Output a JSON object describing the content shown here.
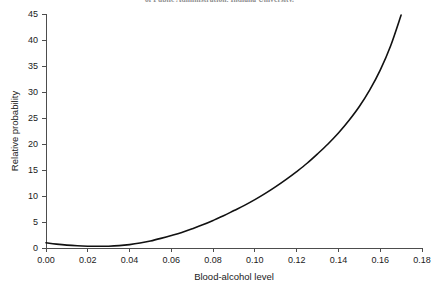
{
  "caption": {
    "cropped_top_line": "of Public Administration, Indiana University."
  },
  "chart_data": {
    "type": "line",
    "title": "",
    "xlabel": "Blood-alcohol level",
    "ylabel": "Relative probability",
    "xlim": [
      0.0,
      0.18
    ],
    "ylim": [
      0,
      45
    ],
    "grid": false,
    "legend": false,
    "legend_position": "none",
    "xticks": [
      "0.00",
      "0.02",
      "0.04",
      "0.06",
      "0.08",
      "0.10",
      "0.12",
      "0.14",
      "0.16",
      "0.18"
    ],
    "xtick_values": [
      0.0,
      0.02,
      0.04,
      0.06,
      0.08,
      0.1,
      0.12,
      0.14,
      0.16,
      0.18
    ],
    "yticks": [
      "0",
      "5",
      "10",
      "15",
      "20",
      "25",
      "30",
      "35",
      "40",
      "45"
    ],
    "ytick_values": [
      0,
      5,
      10,
      15,
      20,
      25,
      30,
      35,
      40,
      45
    ],
    "series": [
      {
        "name": "Relative probability of crash",
        "color": "#111111",
        "x": [
          0.0,
          0.005,
          0.01,
          0.015,
          0.02,
          0.025,
          0.03,
          0.035,
          0.04,
          0.045,
          0.05,
          0.055,
          0.06,
          0.065,
          0.07,
          0.075,
          0.08,
          0.085,
          0.09,
          0.095,
          0.1,
          0.105,
          0.11,
          0.115,
          0.12,
          0.125,
          0.13,
          0.135,
          0.14,
          0.145,
          0.15,
          0.155,
          0.16,
          0.165,
          0.17
        ],
        "values": [
          1.0,
          0.75,
          0.55,
          0.42,
          0.35,
          0.33,
          0.35,
          0.45,
          0.65,
          0.95,
          1.35,
          1.85,
          2.4,
          3.0,
          3.7,
          4.45,
          5.3,
          6.2,
          7.2,
          8.2,
          9.3,
          10.5,
          11.8,
          13.2,
          14.7,
          16.3,
          18.1,
          20.0,
          22.1,
          24.5,
          27.2,
          30.4,
          34.2,
          38.9,
          44.8
        ]
      }
    ],
    "annotations": []
  }
}
